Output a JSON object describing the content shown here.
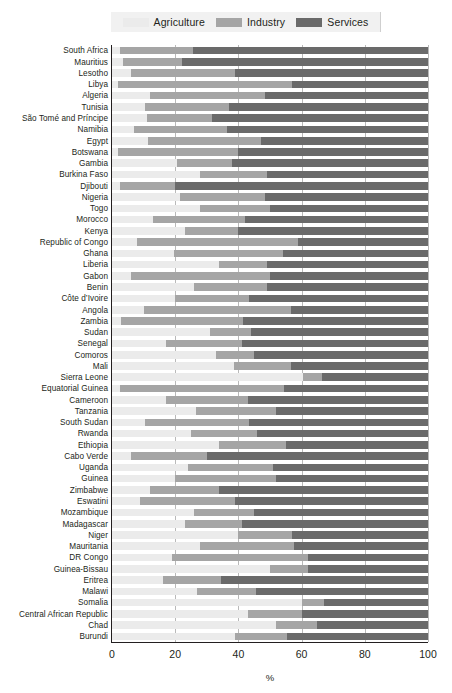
{
  "chart_data": {
    "type": "bar",
    "orientation": "horizontal",
    "stacked": true,
    "title": "",
    "xlabel": "%",
    "ylabel": "",
    "xlim": [
      0,
      100
    ],
    "xticks": [
      0,
      20,
      40,
      60,
      80,
      100
    ],
    "grid": true,
    "legend_position": "top",
    "colors": {
      "agriculture": "#ebebeb",
      "industry": "#a5a5a5",
      "services": "#6a6a6a",
      "axis": "#231f20",
      "gridline": "#b9b9b9",
      "legend_background": "#f1f1f1"
    },
    "series": [
      {
        "name": "Agriculture",
        "key": "agriculture"
      },
      {
        "name": "Industry",
        "key": "industry"
      },
      {
        "name": "Services",
        "key": "services"
      }
    ],
    "categories": [
      "South Africa",
      "Mauritius",
      "Lesotho",
      "Libya",
      "Algeria",
      "Tunisia",
      "São Tomé and Príncipe",
      "Namibia",
      "Egypt",
      "Botswana",
      "Gambia",
      "Burkina Faso",
      "Djibouti",
      "Nigeria",
      "Togo",
      "Morocco",
      "Kenya",
      "Republic of Congo",
      "Ghana",
      "Liberia",
      "Gabon",
      "Benin",
      "Côte d’Ivoire",
      "Angola",
      "Zambia",
      "Sudan",
      "Senegal",
      "Comoros",
      "Mali",
      "Sierra Leone",
      "Equatorial Guinea",
      "Cameroon",
      "Tanzania",
      "South Sudan",
      "Rwanda",
      "Ethiopia",
      "Cabo Verde",
      "Uganda",
      "Guinea",
      "Zimbabwe",
      "Eswatini",
      "Mozambique",
      "Madagascar",
      "Niger",
      "Mauritania",
      "DR Congo",
      "Guinea-Bissau",
      "Eritrea",
      "Malawi",
      "Somalia",
      "Central African Republic",
      "Chad",
      "Burundi"
    ],
    "values": {
      "agriculture": [
        2.5,
        3.5,
        6.0,
        2.0,
        12.0,
        10.5,
        11.0,
        7.0,
        11.5,
        2.0,
        20.5,
        28.0,
        2.5,
        21.5,
        28.0,
        13.0,
        23.0,
        8.0,
        19.5,
        34.0,
        6.0,
        26.0,
        20.0,
        10.0,
        3.0,
        31.0,
        17.0,
        33.0,
        38.5,
        60.5,
        2.5,
        17.0,
        26.5,
        10.5,
        25.0,
        34.0,
        6.0,
        24.0,
        20.0,
        12.0,
        9.0,
        26.0,
        23.0,
        40.0,
        28.0,
        19.0,
        50.0,
        16.0,
        27.0,
        60.0,
        43.0,
        52.0,
        39.0
      ],
      "industry": [
        23.0,
        18.5,
        33.0,
        55.0,
        36.5,
        26.5,
        20.5,
        29.5,
        35.5,
        38.0,
        17.5,
        21.0,
        17.5,
        27.0,
        22.0,
        29.0,
        17.0,
        51.0,
        34.5,
        15.0,
        44.0,
        23.0,
        23.5,
        46.5,
        38.5,
        13.0,
        24.0,
        12.0,
        18.0,
        6.0,
        52.0,
        26.0,
        25.5,
        33.0,
        21.0,
        21.0,
        24.0,
        27.0,
        32.0,
        22.0,
        30.0,
        19.0,
        18.0,
        17.0,
        29.5,
        43.0,
        12.0,
        18.5,
        18.5,
        7.0,
        17.0,
        13.0,
        16.5
      ],
      "services": [
        74.5,
        78.0,
        61.0,
        43.0,
        51.5,
        63.0,
        68.5,
        63.5,
        53.0,
        60.0,
        62.0,
        51.0,
        80.0,
        51.5,
        50.0,
        58.0,
        60.0,
        41.0,
        46.0,
        51.0,
        50.0,
        51.0,
        56.5,
        43.5,
        58.5,
        56.0,
        59.0,
        55.0,
        43.5,
        33.5,
        45.5,
        57.0,
        48.0,
        56.5,
        54.0,
        45.0,
        70.0,
        49.0,
        48.0,
        66.0,
        61.0,
        55.0,
        59.0,
        43.0,
        42.5,
        38.0,
        38.0,
        65.5,
        54.5,
        33.0,
        40.0,
        35.0,
        44.5
      ]
    }
  },
  "legend": {
    "items": [
      {
        "label": "Agriculture",
        "color": "#ebebeb"
      },
      {
        "label": "Industry",
        "color": "#a5a5a5"
      },
      {
        "label": "Services",
        "color": "#6a6a6a"
      }
    ]
  },
  "axis": {
    "x_title": "%",
    "x_ticks": [
      "0",
      "20",
      "40",
      "60",
      "80",
      "100"
    ]
  }
}
